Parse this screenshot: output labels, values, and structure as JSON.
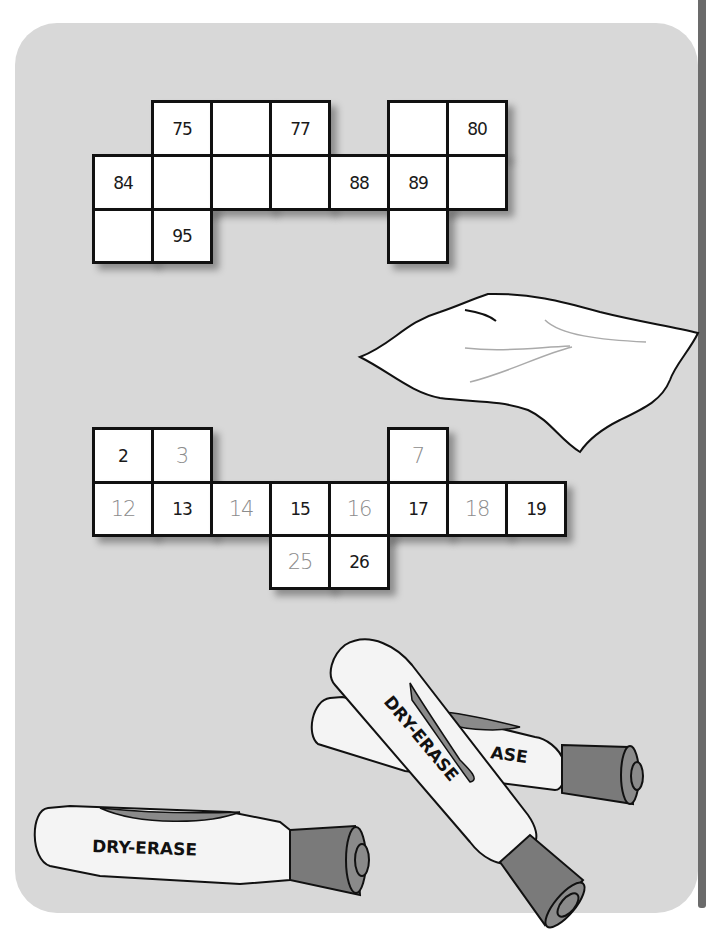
{
  "colors": {
    "panel_background": "#d8d8d8",
    "cell_background": "#ffffff",
    "cell_border": "#111111",
    "black_number": "#1a1a1a",
    "grey_number": "#8c8c8c",
    "marker_cap": "#7a7a7a",
    "side_strip": "#6b6b6b"
  },
  "grid_top": {
    "description": "Hundred-chart fragment, rows 71-100 region",
    "cells": [
      {
        "row": 0,
        "col": 1,
        "value": "75",
        "style": "black"
      },
      {
        "row": 0,
        "col": 2,
        "value": "",
        "style": "black"
      },
      {
        "row": 0,
        "col": 3,
        "value": "77",
        "style": "black"
      },
      {
        "row": 0,
        "col": 5,
        "value": "",
        "style": "black"
      },
      {
        "row": 0,
        "col": 6,
        "value": "80",
        "style": "black"
      },
      {
        "row": 1,
        "col": 0,
        "value": "84",
        "style": "black"
      },
      {
        "row": 1,
        "col": 1,
        "value": "",
        "style": "black"
      },
      {
        "row": 1,
        "col": 2,
        "value": "",
        "style": "black"
      },
      {
        "row": 1,
        "col": 3,
        "value": "",
        "style": "black"
      },
      {
        "row": 1,
        "col": 4,
        "value": "88",
        "style": "black"
      },
      {
        "row": 1,
        "col": 5,
        "value": "89",
        "style": "black"
      },
      {
        "row": 1,
        "col": 6,
        "value": "",
        "style": "black"
      },
      {
        "row": 2,
        "col": 0,
        "value": "",
        "style": "black"
      },
      {
        "row": 2,
        "col": 1,
        "value": "95",
        "style": "black"
      },
      {
        "row": 2,
        "col": 5,
        "value": "",
        "style": "black"
      }
    ]
  },
  "grid_bottom": {
    "description": "Hundred-chart fragment, rows 1-30 region (grey = filled-in answers)",
    "cells": [
      {
        "row": 0,
        "col": 0,
        "value": "2",
        "style": "black"
      },
      {
        "row": 0,
        "col": 1,
        "value": "3",
        "style": "grey"
      },
      {
        "row": 0,
        "col": 5,
        "value": "7",
        "style": "grey"
      },
      {
        "row": 1,
        "col": 0,
        "value": "12",
        "style": "grey"
      },
      {
        "row": 1,
        "col": 1,
        "value": "13",
        "style": "black"
      },
      {
        "row": 1,
        "col": 2,
        "value": "14",
        "style": "grey"
      },
      {
        "row": 1,
        "col": 3,
        "value": "15",
        "style": "black"
      },
      {
        "row": 1,
        "col": 4,
        "value": "16",
        "style": "grey"
      },
      {
        "row": 1,
        "col": 5,
        "value": "17",
        "style": "black"
      },
      {
        "row": 1,
        "col": 6,
        "value": "18",
        "style": "grey"
      },
      {
        "row": 1,
        "col": 7,
        "value": "19",
        "style": "black"
      },
      {
        "row": 2,
        "col": 3,
        "value": "25",
        "style": "grey"
      },
      {
        "row": 2,
        "col": 4,
        "value": "26",
        "style": "black"
      }
    ]
  },
  "illustrations": {
    "cloth": {
      "icon": "eraser-cloth-icon"
    },
    "markers": [
      {
        "icon": "marker-icon",
        "label": "DRY-ERASE",
        "position": "bottom-left"
      },
      {
        "icon": "marker-icon",
        "label": "ASE",
        "position": "back-right (partially hidden)"
      },
      {
        "icon": "marker-icon",
        "label": "DRY-ERASE",
        "position": "front-diagonal"
      }
    ]
  }
}
